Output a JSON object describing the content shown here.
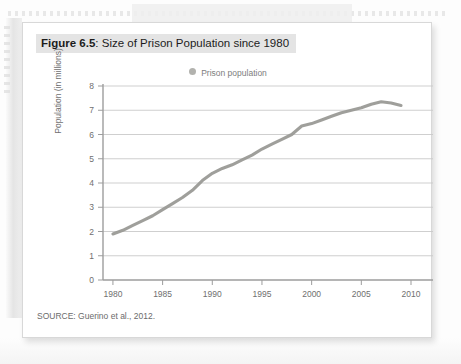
{
  "figure": {
    "caption_label": "Figure 6.5",
    "caption_separator": ": ",
    "caption_text": "Size of Prison Population since 1980",
    "source": "SOURCE: Guerino et al., 2012."
  },
  "legend": {
    "marker_icon": "legend-dot-icon",
    "label": "Prison population",
    "marker_color": "#b2b2ae"
  },
  "colors": {
    "line": "#9a9a96",
    "grid": "#c9c9c9",
    "axis": "#9d9d9d",
    "text": "#6f6f6f",
    "caption_highlight": "#e4e4e4",
    "card_background": "#ffffff",
    "page_background": "#fdfdfd"
  },
  "chart_data": {
    "type": "line",
    "title": "Size of Prison Population since 1980",
    "xlabel": "",
    "ylabel": "Population (in millions)",
    "xlim": [
      1979,
      2010
    ],
    "ylim": [
      0,
      8
    ],
    "xticks": [
      1980,
      1985,
      1990,
      1995,
      2000,
      2005,
      2010
    ],
    "yticks": [
      0,
      1,
      2,
      3,
      4,
      5,
      6,
      7,
      8
    ],
    "grid": "horizontal",
    "legend_position": "top-center",
    "series": [
      {
        "name": "Prison population",
        "color": "#9a9a96",
        "x": [
          1980,
          1981,
          1982,
          1983,
          1984,
          1985,
          1986,
          1987,
          1988,
          1989,
          1990,
          1991,
          1992,
          1993,
          1994,
          1995,
          1996,
          1997,
          1998,
          1999,
          2000,
          2001,
          2002,
          2003,
          2004,
          2005,
          2006,
          2007,
          2008,
          2009
        ],
        "values": [
          1.9,
          2.05,
          2.25,
          2.45,
          2.65,
          2.9,
          3.15,
          3.4,
          3.7,
          4.1,
          4.4,
          4.6,
          4.75,
          4.95,
          5.15,
          5.4,
          5.6,
          5.8,
          6.0,
          6.35,
          6.45,
          6.6,
          6.75,
          6.9,
          7.0,
          7.1,
          7.25,
          7.35,
          7.3,
          7.2
        ]
      }
    ]
  }
}
